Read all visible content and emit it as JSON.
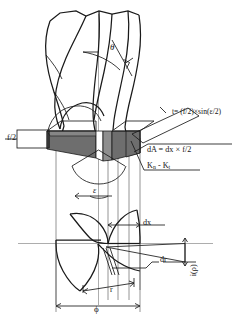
{
  "figure": {
    "kind": "engineering-diagram",
    "background_color": "#ffffff",
    "line_color": "#1a1a1a",
    "chip_fill_dark": "#6e6e6e",
    "chip_fill_mid": "#8f8f8f",
    "chip_fill_light": "#ffffff"
  },
  "labels": {
    "theta": "θ",
    "epsilon": "ε",
    "phi": "ϕ",
    "f_over_2": "f/2",
    "chip_thickness": "t= (f/2)×sin(ε/2)",
    "elemental_area": "dA = dx × f/2",
    "force_components_prefix": "K",
    "force_components_sub1": "n",
    "force_components_mid": " - K",
    "force_components_sub2": "t",
    "force_components_full": "Kn - Kt",
    "dx": "dx",
    "dr": "dr",
    "r": "r",
    "i_rho": "i(ρ)"
  },
  "geometry": {
    "helix_angle_symbol": "θ",
    "point_angle_symbol": "ε",
    "drill_diameter_symbol": "ϕ",
    "feed_per_tooth": "f/2",
    "radial_element": "dr",
    "axial_element": "dx",
    "radius": "r",
    "inclination": "i(ρ)"
  },
  "annotations": [
    {
      "name": "helix-angle",
      "text": "θ"
    },
    {
      "name": "point-angle",
      "text": "ε"
    },
    {
      "name": "drill-diameter",
      "text": "ϕ"
    },
    {
      "name": "feed-half",
      "text": "f/2"
    },
    {
      "name": "chip-thickness-formula",
      "text": "t= (f/2)×sin(ε/2)"
    },
    {
      "name": "chip-area-formula",
      "text": "dA = dx × f/2"
    },
    {
      "name": "cutting-force-components",
      "text": "Kn - Kt"
    },
    {
      "name": "axial-increment",
      "text": "dx"
    },
    {
      "name": "radial-increment",
      "text": "dr"
    },
    {
      "name": "radius",
      "text": "r"
    },
    {
      "name": "inclination-angle",
      "text": "i(ρ)"
    }
  ]
}
